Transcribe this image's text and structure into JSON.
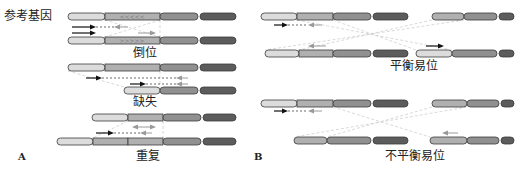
{
  "figure": {
    "panel_a": {
      "letter": "A",
      "reference_label": "参考基因",
      "inversion_label": "倒位",
      "deletion_label": "缺失",
      "duplication_label": "重复"
    },
    "panel_b": {
      "letter": "B",
      "balanced_label": "平衡易位",
      "unbalanced_label": "不平衡易位"
    }
  },
  "colors": {
    "seg_light": "#dcdcdc",
    "seg_medium": "#b0b0b0",
    "seg_dark": "#909090",
    "seg_darkest": "#5c5c5c",
    "outline": "#3a3a3a",
    "arrow_black": "#111111",
    "arrow_gray": "#9a9a9a",
    "guide_line": "#cfcfcf"
  },
  "chromosomes": [
    {
      "id": "ref",
      "y": 13,
      "segments": [
        [
          68,
          105,
          "seg_light"
        ],
        [
          105,
          160,
          "seg_medium"
        ],
        [
          160,
          198,
          "seg_dark"
        ],
        [
          200,
          236,
          "seg_darkest"
        ]
      ],
      "marks": "<<<<<"
    },
    {
      "id": "inv",
      "y": 37,
      "segments": [
        [
          68,
          105,
          "seg_light"
        ],
        [
          105,
          160,
          "seg_medium"
        ],
        [
          160,
          198,
          "seg_dark"
        ],
        [
          200,
          236,
          "seg_darkest"
        ]
      ],
      "marks": ">>>>>"
    },
    {
      "id": "del_ref",
      "y": 64,
      "segments": [
        [
          68,
          105,
          "seg_light"
        ],
        [
          105,
          160,
          "seg_medium"
        ],
        [
          160,
          198,
          "seg_dark"
        ],
        [
          200,
          236,
          "seg_darkest"
        ]
      ]
    },
    {
      "id": "del",
      "y": 87,
      "segments": [
        [
          124,
          160,
          "seg_light"
        ],
        [
          160,
          198,
          "seg_dark"
        ],
        [
          200,
          236,
          "seg_darkest"
        ]
      ]
    },
    {
      "id": "dup_ref",
      "y": 114,
      "segments": [
        [
          92,
          128,
          "seg_light"
        ],
        [
          128,
          163,
          "seg_medium"
        ],
        [
          163,
          201,
          "seg_dark"
        ],
        [
          203,
          236,
          "seg_darkest"
        ]
      ]
    },
    {
      "id": "dup",
      "y": 138,
      "segments": [
        [
          57,
          93,
          "seg_light"
        ],
        [
          93,
          128,
          "seg_medium"
        ],
        [
          128,
          163,
          "seg_medium"
        ],
        [
          163,
          201,
          "seg_dark"
        ],
        [
          203,
          236,
          "seg_darkest"
        ]
      ]
    },
    {
      "id": "bt_l1",
      "y": 13,
      "segments": [
        [
          261,
          297,
          "seg_light"
        ],
        [
          297,
          333,
          "seg_medium"
        ],
        [
          333,
          371,
          "seg_dark"
        ],
        [
          373,
          408,
          "seg_darkest"
        ]
      ]
    },
    {
      "id": "bt_r1",
      "y": 13,
      "segments": [
        [
          432,
          464,
          "seg_medium"
        ],
        [
          464,
          497,
          "seg_dark"
        ],
        [
          499,
          514,
          "seg_darkest"
        ]
      ]
    },
    {
      "id": "bt_l2",
      "y": 50,
      "segments": [
        [
          265,
          299,
          "seg_light"
        ],
        [
          299,
          333,
          "seg_medium"
        ],
        [
          333,
          371,
          "seg_dark"
        ],
        [
          373,
          408,
          "seg_darkest"
        ]
      ]
    },
    {
      "id": "bt_r2",
      "y": 50,
      "segments": [
        [
          416,
          452,
          "seg_light"
        ],
        [
          452,
          497,
          "seg_dark"
        ],
        [
          499,
          514,
          "seg_darkest"
        ]
      ]
    },
    {
      "id": "ut_l1",
      "y": 100,
      "segments": [
        [
          261,
          297,
          "seg_light"
        ],
        [
          297,
          333,
          "seg_medium"
        ],
        [
          333,
          371,
          "seg_dark"
        ],
        [
          373,
          408,
          "seg_darkest"
        ]
      ]
    },
    {
      "id": "ut_r1",
      "y": 100,
      "segments": [
        [
          432,
          467,
          "seg_medium"
        ],
        [
          467,
          499,
          "seg_dark"
        ],
        [
          501,
          514,
          "seg_darkest"
        ]
      ]
    },
    {
      "id": "ut_l2",
      "y": 137,
      "segments": [
        [
          294,
          327,
          "seg_medium"
        ],
        [
          327,
          371,
          "seg_dark"
        ],
        [
          373,
          408,
          "seg_darkest"
        ]
      ]
    },
    {
      "id": "ut_r2",
      "y": 137,
      "segments": [
        [
          430,
          467,
          "seg_medium"
        ],
        [
          467,
          499,
          "seg_dark"
        ],
        [
          501,
          514,
          "seg_darkest"
        ]
      ]
    }
  ]
}
